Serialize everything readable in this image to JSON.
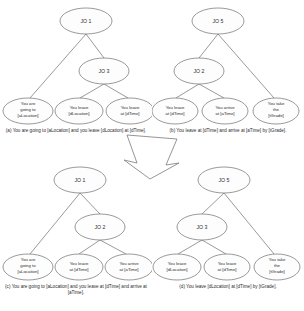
{
  "figure": {
    "arrow_icon": "down-arrow-icon",
    "panels": [
      {
        "id": "a",
        "root": "JO 1",
        "internal": "JO 3",
        "layout": "left-leaf-then-internal",
        "leaves": [
          {
            "lines": [
              "You are",
              "going to",
              "[aLocation]"
            ]
          },
          {
            "lines": [
              "You leave",
              "[dLocation]"
            ]
          },
          {
            "lines": [
              "You leave",
              "at [dTime]"
            ]
          }
        ],
        "caption": "(a) You are going to [aLocation] and you leave [dLocation] at [dTime]."
      },
      {
        "id": "b",
        "root": "JO 5",
        "internal": "JO 2",
        "layout": "internal-then-right-leaf",
        "leaves": [
          {
            "lines": [
              "You leave",
              "at [dTime]"
            ]
          },
          {
            "lines": [
              "You arrive",
              "at [aTime]"
            ]
          },
          {
            "lines": [
              "You take",
              "the",
              "[tGrade]"
            ]
          }
        ],
        "caption": "(b) You leave at [dTime] and arrive at [aTime] by [tGrade]."
      },
      {
        "id": "c",
        "root": "JO 1",
        "internal": "JO 2",
        "layout": "left-leaf-then-internal",
        "leaves": [
          {
            "lines": [
              "You are",
              "going to",
              "[aLocation]"
            ]
          },
          {
            "lines": [
              "You leave",
              "at [dTime]"
            ]
          },
          {
            "lines": [
              "You arrive",
              "at [aTime]"
            ]
          }
        ],
        "caption": "(c) You are going to [aLocation] and you leave at [dTime] and arrive at [aTime]."
      },
      {
        "id": "d",
        "root": "JO 5",
        "internal": "JO 3",
        "layout": "internal-then-right-leaf",
        "leaves": [
          {
            "lines": [
              "You leave",
              "[dLocation]"
            ]
          },
          {
            "lines": [
              "You leave",
              "at [dTime]"
            ]
          },
          {
            "lines": [
              "You take",
              "the",
              "[tGrade]"
            ]
          }
        ],
        "caption": "(d) You leave [dLocation] at [dTime] by [tGrade]."
      }
    ]
  }
}
